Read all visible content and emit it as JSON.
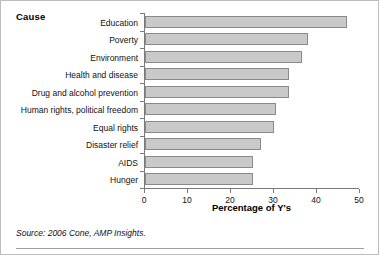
{
  "figure": {
    "category_axis_title": "Cause",
    "source_note": "Source: 2006 Cone, AMP Insights."
  },
  "chart_data": {
    "type": "bar",
    "orientation": "horizontal",
    "title": "",
    "xlabel": "Percentage of Y's",
    "ylabel": "Cause",
    "xlim": [
      0,
      50
    ],
    "xticks": [
      0,
      10,
      20,
      30,
      40,
      50
    ],
    "xtick_labels": [
      "0",
      "10",
      "20",
      "30",
      "40",
      "50"
    ],
    "grid": false,
    "legend": false,
    "bar_fill_color": "#c9c9c9",
    "bar_edge_color": "#8a8a8a",
    "categories": [
      "Education",
      "Poverty",
      "Environment",
      "Health and disease",
      "Drug and alcohol prevention",
      "Human rights, political freedom",
      "Equal rights",
      "Disaster relief",
      "AIDS",
      "Hunger"
    ],
    "values": [
      47,
      38,
      36.5,
      33.5,
      33.5,
      30.5,
      30,
      27,
      25,
      25
    ],
    "source": "Source: 2006 Cone, AMP Insights."
  }
}
